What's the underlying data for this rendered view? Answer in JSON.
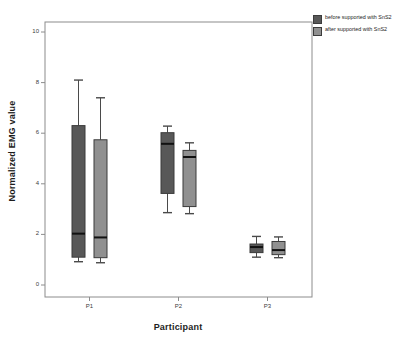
{
  "chart_data": {
    "type": "box",
    "title": "",
    "xlabel": "Participant",
    "ylabel": "Normalized EMG value",
    "categories": [
      "P1",
      "P2",
      "P3"
    ],
    "ylim": [
      -0.35,
      10.6
    ],
    "yticks": [
      0,
      2,
      4,
      6,
      8,
      10
    ],
    "ytick_labels": [
      "0",
      "2",
      "4",
      "6",
      "8",
      "10"
    ],
    "grid": false,
    "legend_position": "top-right-outside",
    "series": [
      {
        "name": "before supported with SnS2",
        "color": "#585858",
        "boxes": [
          {
            "category": "P1",
            "whisker_low": 0.92,
            "q1": 1.1,
            "median": 2.03,
            "q3": 6.3,
            "whisker_high": 8.1
          },
          {
            "category": "P2",
            "whisker_low": 2.86,
            "q1": 3.62,
            "median": 5.58,
            "q3": 6.02,
            "whisker_high": 6.28
          },
          {
            "category": "P3",
            "whisker_low": 1.1,
            "q1": 1.28,
            "median": 1.5,
            "q3": 1.62,
            "whisker_high": 1.92
          }
        ]
      },
      {
        "name": "after supported with SnS2",
        "color": "#909090",
        "boxes": [
          {
            "category": "P1",
            "whisker_low": 0.88,
            "q1": 1.08,
            "median": 1.88,
            "q3": 5.74,
            "whisker_high": 7.4
          },
          {
            "category": "P2",
            "whisker_low": 2.82,
            "q1": 3.1,
            "median": 5.06,
            "q3": 5.32,
            "whisker_high": 5.62
          },
          {
            "category": "P3",
            "whisker_low": 1.08,
            "q1": 1.2,
            "median": 1.38,
            "q3": 1.72,
            "whisker_high": 1.9
          }
        ]
      }
    ]
  },
  "legend": {
    "items": [
      {
        "label": "before supported with SnS2",
        "color": "#585858"
      },
      {
        "label": "after supported with SnS2",
        "color": "#909090"
      }
    ]
  },
  "axes": {
    "y_title": "Normalized EMG value",
    "x_title": "Participant"
  }
}
